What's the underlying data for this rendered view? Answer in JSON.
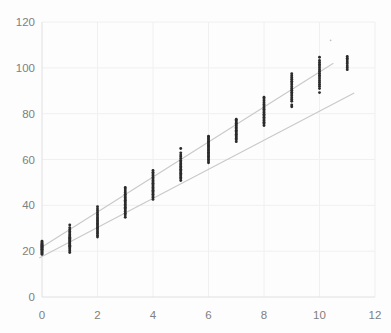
{
  "chart_data": {
    "type": "scatter",
    "title": "",
    "xlabel": "",
    "ylabel": "",
    "xlim": [
      0,
      12
    ],
    "ylim": [
      0,
      120
    ],
    "xticks": [
      0,
      2,
      4,
      6,
      8,
      10,
      12
    ],
    "yticks": [
      0,
      20,
      40,
      60,
      80,
      100,
      120
    ],
    "grid": true,
    "legend": false,
    "legend_position": "none",
    "series": [
      {
        "name": "observations",
        "type": "scatter",
        "x": [
          0,
          0,
          0,
          0,
          0,
          0,
          0,
          0,
          0,
          0,
          0,
          0,
          0,
          0,
          0,
          0,
          0,
          0,
          1,
          1,
          1,
          1,
          1,
          1,
          1,
          1,
          1,
          1,
          1,
          1,
          1,
          1,
          1,
          1,
          1,
          1,
          1,
          1,
          2,
          2,
          2,
          2,
          2,
          2,
          2,
          2,
          2,
          2,
          2,
          2,
          2,
          2,
          2,
          2,
          2,
          2,
          2,
          2,
          3,
          3,
          3,
          3,
          3,
          3,
          3,
          3,
          3,
          3,
          3,
          3,
          3,
          3,
          3,
          3,
          3,
          3,
          3,
          3,
          4,
          4,
          4,
          4,
          4,
          4,
          4,
          4,
          4,
          4,
          4,
          4,
          4,
          4,
          4,
          4,
          4,
          4,
          4,
          4,
          5,
          5,
          5,
          5,
          5,
          5,
          5,
          5,
          5,
          5,
          5,
          5,
          5,
          5,
          5,
          5,
          5,
          5,
          5,
          5,
          6,
          6,
          6,
          6,
          6,
          6,
          6,
          6,
          6,
          6,
          6,
          6,
          6,
          6,
          6,
          6,
          6,
          6,
          6,
          6,
          7,
          7,
          7,
          7,
          7,
          7,
          7,
          7,
          7,
          7,
          7,
          7,
          7,
          7,
          7,
          7,
          7,
          8,
          8,
          8,
          8,
          8,
          8,
          8,
          8,
          8,
          8,
          8,
          8,
          8,
          8,
          8,
          8,
          8,
          8,
          9,
          9,
          9,
          9,
          9,
          9,
          9,
          9,
          9,
          9,
          9,
          9,
          9,
          9,
          9,
          9,
          9,
          9,
          10,
          10,
          10,
          10,
          10,
          10,
          10,
          10,
          10,
          10,
          10,
          10,
          10,
          10,
          10,
          10,
          10,
          10,
          11,
          11,
          11,
          11,
          11,
          11,
          11,
          11
        ],
        "y": [
          18.6,
          19.0,
          19.4,
          19.8,
          20.2,
          20.5,
          20.8,
          21.1,
          21.4,
          21.7,
          22.0,
          22.3,
          22.6,
          22.9,
          23.2,
          23.6,
          24.0,
          24.4,
          19.4,
          20.2,
          20.9,
          21.5,
          22.1,
          22.6,
          23.1,
          23.6,
          24.1,
          24.6,
          25.1,
          25.6,
          26.1,
          26.6,
          27.2,
          27.9,
          28.6,
          29.4,
          30.2,
          31.4,
          26.2,
          27.0,
          27.8,
          28.5,
          29.2,
          29.8,
          30.4,
          31.0,
          31.6,
          32.2,
          32.8,
          33.4,
          34.0,
          34.6,
          35.3,
          36.0,
          36.8,
          37.6,
          38.4,
          39.4,
          34.8,
          35.8,
          36.6,
          37.3,
          38.0,
          38.6,
          39.2,
          39.8,
          40.4,
          41.0,
          41.6,
          42.2,
          42.8,
          43.4,
          44.1,
          44.8,
          45.5,
          46.3,
          47.1,
          47.8,
          42.6,
          43.4,
          44.1,
          44.8,
          45.4,
          46.0,
          46.6,
          47.2,
          47.8,
          48.4,
          49.0,
          49.6,
          50.2,
          50.8,
          51.5,
          52.2,
          52.9,
          53.7,
          54.4,
          55.2,
          50.8,
          51.6,
          52.2,
          52.8,
          53.4,
          54.0,
          54.6,
          55.2,
          55.8,
          56.4,
          57.0,
          57.6,
          58.2,
          58.9,
          59.6,
          60.4,
          61.2,
          62.0,
          62.9,
          64.8,
          58.6,
          59.4,
          60.1,
          60.8,
          61.4,
          62.0,
          62.6,
          63.2,
          63.8,
          64.4,
          65.0,
          65.6,
          66.2,
          66.8,
          67.4,
          68.0,
          68.6,
          69.2,
          69.8,
          70.2,
          67.8,
          68.6,
          69.2,
          69.8,
          70.4,
          71.0,
          71.6,
          72.2,
          72.8,
          73.4,
          74.0,
          74.6,
          75.2,
          75.8,
          76.4,
          77.0,
          77.6,
          74.8,
          75.6,
          76.3,
          77.0,
          77.7,
          78.4,
          79.1,
          79.8,
          80.5,
          81.2,
          81.9,
          82.6,
          83.3,
          84.0,
          84.8,
          85.6,
          86.4,
          87.2,
          83.0,
          83.8,
          85.4,
          86.2,
          87.0,
          87.8,
          88.6,
          89.4,
          90.2,
          91.0,
          91.8,
          92.6,
          93.4,
          94.2,
          95.0,
          95.8,
          96.6,
          97.4,
          89.2,
          91.0,
          92.0,
          92.8,
          93.6,
          94.4,
          95.2,
          96.0,
          96.8,
          97.6,
          98.4,
          99.2,
          100.0,
          100.8,
          101.6,
          102.4,
          103.2,
          104.6,
          99.2,
          100.0,
          100.8,
          101.8,
          102.6,
          103.4,
          104.2,
          105.0
        ]
      },
      {
        "name": "faint-outlier",
        "type": "scatter",
        "x": [
          10.4
        ],
        "y": [
          112.0
        ]
      },
      {
        "name": "trend-line-upper",
        "type": "line",
        "x": [
          0.0,
          10.5
        ],
        "y": [
          21.8,
          102.0
        ]
      },
      {
        "name": "trend-line-lower",
        "type": "line",
        "x": [
          -0.1,
          11.25
        ],
        "y": [
          17.0,
          89.0
        ]
      }
    ]
  },
  "axes": {
    "y_tick_labels": [
      "0",
      "20",
      "40",
      "60",
      "80",
      "100",
      "120"
    ],
    "x_tick_labels": [
      "0",
      "2",
      "4",
      "6",
      "8",
      "10",
      "12"
    ]
  },
  "colors": {
    "point": "#2b2b2b",
    "point_faint": "#c0c0c0",
    "trend": "#c9c9c9",
    "grid": "#f0f0f0",
    "axis": "#e0e0e0",
    "tick_text": "#808080",
    "background": "#fdfdfd"
  },
  "plot_box": {
    "left": 42,
    "top": 22,
    "right": 375,
    "bottom": 297
  }
}
